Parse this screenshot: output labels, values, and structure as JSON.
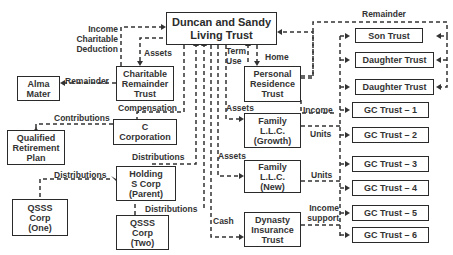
{
  "diagram": {
    "nodes": {
      "living_trust": "Duncan and Sandy\nLiving Trust",
      "crt": "Charitable\nRemainder\nTrust",
      "alma_mater": "Alma\nMater",
      "c_corp": "C\nCorporation",
      "qrp": "Qualified\nRetirement\nPlan",
      "holding": "Holding\nS Corp\n(Parent)",
      "qsss_one": "QSSS\nCorp\n(One)",
      "qsss_two": "QSSS\nCorp\n(Two)",
      "prt": "Personal\nResidence\nTrust",
      "llc_growth": "Family\nL.L.C.\n(Growth)",
      "llc_new": "Family\nL.L.C.\n(New)",
      "dynasty": "Dynasty\nInsurance\nTrust",
      "son": "Son Trust",
      "daughter1": "Daughter Trust",
      "daughter2": "Daughter Trust",
      "gc1": "GC Trust – 1",
      "gc2": "GC Trust – 2",
      "gc3": "GC Trust – 3",
      "gc4": "GC Trust – 4",
      "gc5": "GC Trust – 5",
      "gc6": "GC Trust – 6"
    },
    "edge_labels": {
      "income_charitable_deduction": "Income\nCharitable\nDeduction",
      "assets_crt": "Assets",
      "remainder_alma": "Remainder",
      "compensation": "Compensation",
      "contributions": "Contributions",
      "distributions_holding": "Distributions",
      "distributions_one": "Distributions",
      "distributions_two": "Distributions",
      "term_use": "Term\nUse",
      "home": "Home",
      "assets_growth": "Assets",
      "assets_new": "Assets",
      "income_prt": "Income",
      "units_growth": "Units",
      "units_new": "Units",
      "income_support": "Income\nsupport",
      "cash": "Cash",
      "remainder_children": "Remainder"
    }
  }
}
